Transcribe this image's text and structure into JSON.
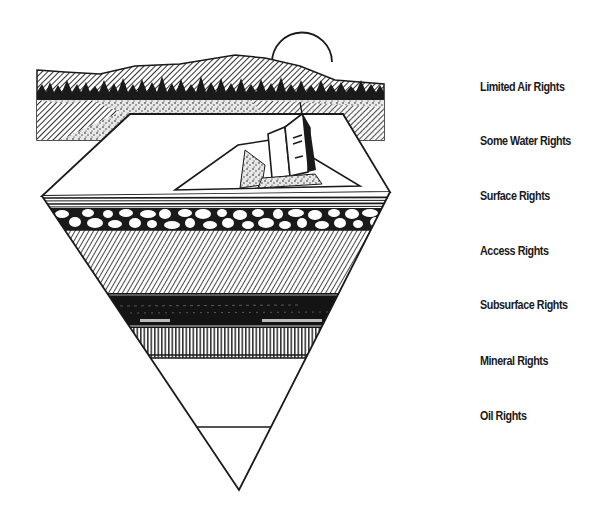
{
  "diagram": {
    "type": "inverted-triangle cross-section",
    "illustration": {
      "sky_elements": [
        "sun",
        "mountain-ridge",
        "forest-treeline"
      ],
      "surface_elements": [
        "land-parcel",
        "house"
      ],
      "strata": [
        "topsoil-band",
        "gravel-cobble-layer",
        "diagonal-hatched-layer",
        "dark-layer",
        "vertical-hatched-layer",
        "blank-layer",
        "bottom-apex-layer"
      ]
    },
    "labels": [
      {
        "text": "Limited Air Rights",
        "y": 87
      },
      {
        "text": "Some Water Rights",
        "y": 141
      },
      {
        "text": "Surface Rights",
        "y": 196
      },
      {
        "text": "Access Rights",
        "y": 251
      },
      {
        "text": "Subsurface Rights",
        "y": 305
      },
      {
        "text": "Mineral Rights",
        "y": 361
      },
      {
        "text": "Oil Rights",
        "y": 416
      }
    ],
    "colors": {
      "ink": "#1a1a1a",
      "paper": "#ffffff"
    }
  }
}
